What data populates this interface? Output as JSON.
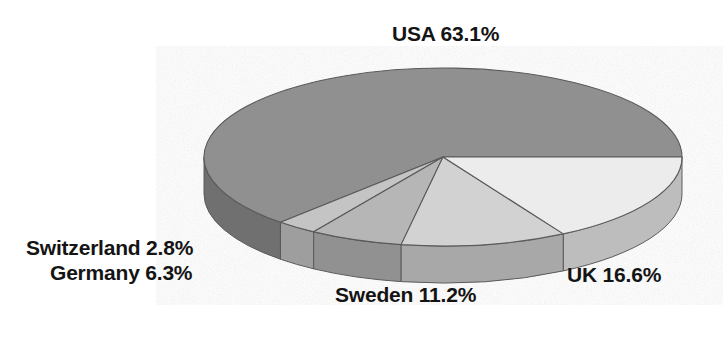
{
  "chart_data": {
    "type": "pie",
    "title": "",
    "subtitle": "",
    "xlabel": "",
    "ylabel": "",
    "legend_position": "none",
    "grid": false,
    "three_d": true,
    "units": "percent",
    "categories": [
      "USA",
      "UK",
      "Sweden",
      "Germany",
      "Switzerland"
    ],
    "values": [
      63.1,
      16.6,
      11.2,
      6.3,
      2.8
    ],
    "slices": [
      {
        "name": "USA",
        "value": 63.1,
        "label": "USA 63.1%",
        "percent_text": "63.1%",
        "color": "#909090",
        "side_color": "#6f6f6f",
        "start_angle": 0,
        "sweep_angle": 227.16
      },
      {
        "name": "Switzerland",
        "value": 2.8,
        "label": "Switzerland 2.8%",
        "percent_text": "2.8%",
        "color": "#c4c4c4",
        "side_color": "#9e9e9e",
        "start_angle": 227.16,
        "sweep_angle": 10.08
      },
      {
        "name": "Germany",
        "value": 6.3,
        "label": "Germany 6.3%",
        "percent_text": "6.3%",
        "color": "#b6b6b6",
        "side_color": "#919191",
        "start_angle": 237.24,
        "sweep_angle": 22.68
      },
      {
        "name": "Sweden",
        "value": 11.2,
        "label": "Sweden 11.2%",
        "percent_text": "11.2%",
        "color": "#d2d2d2",
        "side_color": "#a8a8a8",
        "start_angle": 259.92,
        "sweep_angle": 40.32
      },
      {
        "name": "UK",
        "value": 16.6,
        "label": "UK 16.6%",
        "percent_text": "16.6%",
        "color": "#ececec",
        "side_color": "#bdbdbd",
        "start_angle": 300.24,
        "sweep_angle": 59.76
      }
    ],
    "total": 100.0
  },
  "labels": {
    "usa": "USA 63.1%",
    "uk": "UK 16.6%",
    "sweden": "Sweden 11.2%",
    "germany": "Germany 6.3%",
    "switzerland": "Switzerland 2.8%"
  },
  "colors": {
    "background": "#ffffff",
    "text": "#141414",
    "usa": "#909090",
    "uk": "#ececec",
    "sweden": "#d2d2d2",
    "germany": "#b6b6b6",
    "switzerland": "#c4c4c4",
    "outline": "#5a5a5a"
  }
}
